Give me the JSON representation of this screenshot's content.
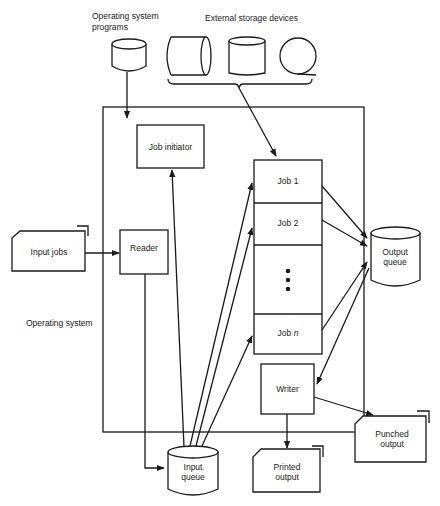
{
  "diagram": {
    "type": "flowchart",
    "labels": {
      "os_programs_line1": "Operating system",
      "os_programs_line2": "programs",
      "external_storage": "External storage devices",
      "operating_system": "Operating system",
      "job_initiator": "Job initiator",
      "input_jobs": "Input jobs",
      "reader": "Reader",
      "job1": "Job 1",
      "job2": "Job 2",
      "ellipsis": "⋮",
      "jobn_prefix": "Job ",
      "jobn_suffix": "n",
      "output_queue_line1": "Output",
      "output_queue_line2": "queue",
      "writer": "Writer",
      "input_queue_line1": "Input",
      "input_queue_line2": "queue",
      "printed_output_line1": "Printed",
      "printed_output_line2": "output",
      "punched_output_line1": "Punched",
      "punched_output_line2": "output"
    },
    "nodes": [
      {
        "id": "os_programs",
        "shape": "cylinder",
        "label": "Operating system programs"
      },
      {
        "id": "ext_disk_horizontal",
        "shape": "horizontal-cylinder",
        "group": "External storage devices"
      },
      {
        "id": "ext_disk_vertical",
        "shape": "cylinder",
        "group": "External storage devices"
      },
      {
        "id": "ext_tape",
        "shape": "tape-reel",
        "group": "External storage devices"
      },
      {
        "id": "operating_system",
        "shape": "container",
        "label": "Operating system"
      },
      {
        "id": "job_initiator",
        "shape": "rect",
        "label": "Job initiator"
      },
      {
        "id": "input_jobs",
        "shape": "card-stack",
        "label": "Input jobs"
      },
      {
        "id": "reader",
        "shape": "rect",
        "label": "Reader"
      },
      {
        "id": "job_column",
        "shape": "stacked-rect",
        "items": [
          "Job 1",
          "Job 2",
          "⋮",
          "Job n"
        ]
      },
      {
        "id": "output_queue",
        "shape": "cylinder",
        "label": "Output queue"
      },
      {
        "id": "writer",
        "shape": "rect",
        "label": "Writer"
      },
      {
        "id": "input_queue",
        "shape": "cylinder",
        "label": "Input queue"
      },
      {
        "id": "printed_output",
        "shape": "document",
        "label": "Printed output"
      },
      {
        "id": "punched_output",
        "shape": "card-stack",
        "label": "Punched output"
      }
    ],
    "edges": [
      {
        "from": "os_programs",
        "to": "job_initiator"
      },
      {
        "from": "External storage devices",
        "to": "Job 1"
      },
      {
        "from": "input_jobs",
        "to": "reader"
      },
      {
        "from": "reader",
        "to": "input_queue"
      },
      {
        "from": "input_queue",
        "to": "job_initiator"
      },
      {
        "from": "input_queue",
        "to": "Job 1"
      },
      {
        "from": "input_queue",
        "to": "Job 2"
      },
      {
        "from": "input_queue",
        "to": "Job n"
      },
      {
        "from": "Job 1",
        "to": "output_queue"
      },
      {
        "from": "Job 2",
        "to": "output_queue"
      },
      {
        "from": "Job n",
        "to": "output_queue"
      },
      {
        "from": "output_queue",
        "to": "writer"
      },
      {
        "from": "writer",
        "to": "printed_output"
      },
      {
        "from": "writer",
        "to": "punched_output"
      }
    ]
  }
}
